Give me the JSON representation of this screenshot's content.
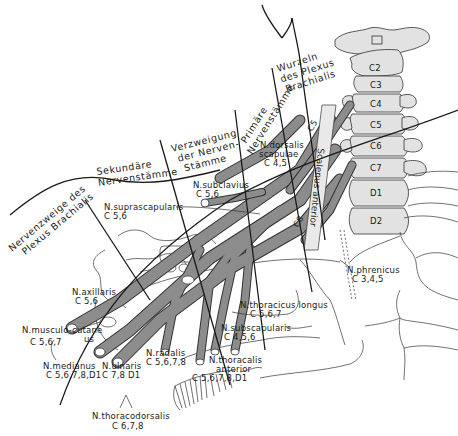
{
  "diagram": {
    "subject": "Plexus brachialis",
    "zones": [
      {
        "id": "wurzeln",
        "lines": [
          "Wurzeln",
          "des Plexus",
          "Brachialis"
        ]
      },
      {
        "id": "primaere",
        "lines": [
          "Primäre",
          "Nervenstämme"
        ]
      },
      {
        "id": "verzweigung",
        "lines": [
          "Verzweigung",
          "der Nerven-",
          "Stämme"
        ]
      },
      {
        "id": "sekundaere",
        "lines": [
          "Sekundäre",
          "Nervenstämme"
        ]
      },
      {
        "id": "nervenzweige",
        "lines": [
          "Nervenzweige des",
          "Plexus Brachialis"
        ]
      }
    ],
    "vertebrae": [
      "C2",
      "C3",
      "C4",
      "C5",
      "C6",
      "C7",
      "D1",
      "D2"
    ],
    "root_markers": [
      "C5",
      "C8"
    ],
    "vertical_label": "Scalenus anterior",
    "nerves": [
      {
        "name": "N.dorsalis scapulae",
        "line1": "N.dorsalis",
        "line2": "scapulae",
        "segments": "C 4,5"
      },
      {
        "name": "N.subclavius",
        "line1": "N.subclavius",
        "segments": "C 5,6"
      },
      {
        "name": "N.suprascapularis",
        "line1": "N.suprascapularis",
        "segments": "C 5,6"
      },
      {
        "name": "N.axillaris",
        "line1": "N.axillaris",
        "segments": "C 5,6"
      },
      {
        "name": "N.musculo-cutaneus",
        "line1": "N.musculo-cutane",
        "line2": "us",
        "segments": "C 5,6,7"
      },
      {
        "name": "N.medianus",
        "line1": "N.medianus",
        "segments": "C 5,6,7,8,D1"
      },
      {
        "name": "N.ulnaris",
        "line1": "N.ulnaris",
        "segments": "C 7,8  D1"
      },
      {
        "name": "N.radialis",
        "line1": "N.radalis",
        "segments": "C 5,6,7,8"
      },
      {
        "name": "N.thoracalis anterior",
        "line1": "N.thoracalis",
        "line2": "anterior",
        "segments": "C 5,6,7,8,D1"
      },
      {
        "name": "N.thoracodorsalis",
        "line1": "N.thoracodorsalis",
        "segments": "C 6,7,8"
      },
      {
        "name": "N.thoracicus longus",
        "line1": "N.thoracicus  longus",
        "segments": "C 5,6,7"
      },
      {
        "name": "N.subscapularis",
        "line1": "N.subscapularis",
        "segments": "C  4,5,6"
      },
      {
        "name": "N.phrenicus",
        "line1": "N.phrenicus",
        "segments": "C  3,4,5"
      }
    ],
    "colors": {
      "ink": "#1a1a1a",
      "nerve_fill": "#8c8c8c",
      "bone_fill": "#e2e2e2",
      "background": "#ffffff"
    }
  }
}
